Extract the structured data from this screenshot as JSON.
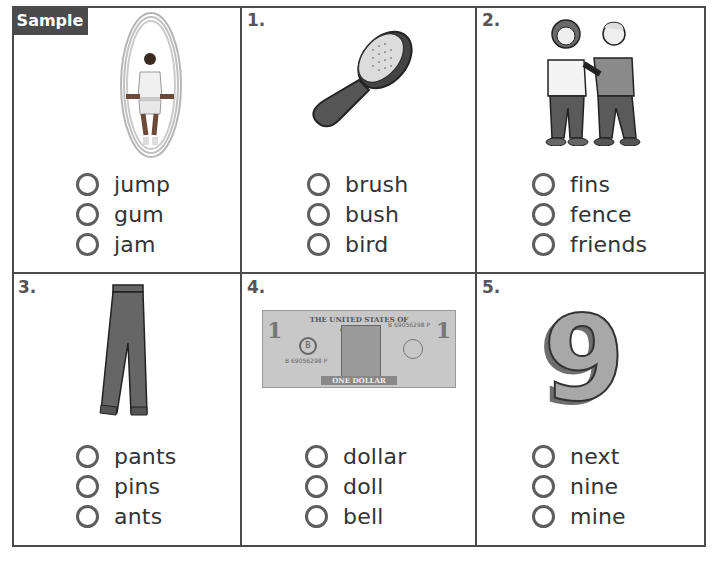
{
  "worksheet": {
    "sample_label": "Sample",
    "items": [
      {
        "number": "",
        "picture": "jump-rope-boy",
        "options": [
          "jump",
          "gum",
          "jam"
        ]
      },
      {
        "number": "1.",
        "picture": "hair-brush",
        "options": [
          "brush",
          "bush",
          "bird"
        ]
      },
      {
        "number": "2.",
        "picture": "two-friends",
        "options": [
          "fins",
          "fence",
          "friends"
        ]
      },
      {
        "number": "3.",
        "picture": "pants",
        "options": [
          "pants",
          "pins",
          "ants"
        ]
      },
      {
        "number": "4.",
        "picture": "one-dollar-bill",
        "options": [
          "dollar",
          "doll",
          "bell"
        ]
      },
      {
        "number": "5.",
        "picture": "number-nine",
        "options": [
          "next",
          "nine",
          "mine"
        ]
      }
    ],
    "dollar_bill": {
      "top_text": "THE UNITED STATES OF AMERICA",
      "bottom_text": "ONE DOLLAR",
      "serial": "B 69056298 P",
      "denomination": "1",
      "seal_letter": "B"
    },
    "nine_glyph": "9"
  },
  "colors": {
    "grid_line": "#4a4a4a",
    "badge_bg": "#4b4b4b",
    "bubble": "#5e5e5e",
    "illustration_dark": "#5a5a5a",
    "illustration_mid": "#8a8a8a"
  }
}
